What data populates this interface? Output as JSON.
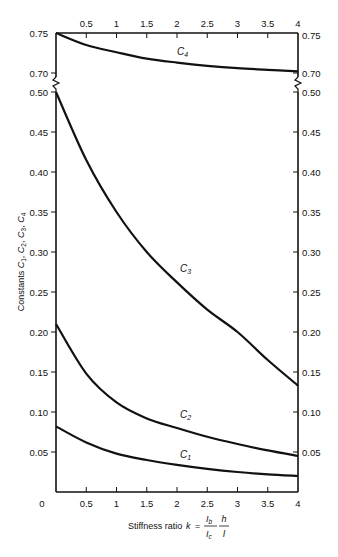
{
  "chart_data": {
    "type": "line",
    "title": "",
    "xlabel": "Stiffness ratio k = (I_b / I_c)(h / l)",
    "xlabel_parts": {
      "prefix": "Stiffness ratio",
      "var": "k",
      "eq": "=",
      "num1": "I",
      "num1_sub": "b",
      "den1": "I",
      "den1_sub": "c",
      "num2": "h",
      "den2": "l"
    },
    "ylabel": "Constants C1, C2, C3, C4",
    "ylabel_parts": {
      "prefix": "Constants",
      "terms": [
        "C1",
        "C2",
        "C3",
        "C4"
      ]
    },
    "xlim": [
      0,
      4
    ],
    "ylim_lower": [
      0,
      0.5
    ],
    "ylim_upper": [
      0.7,
      0.75
    ],
    "axis_break": "between 0.50 and 0.70 on both y axes",
    "x_ticks_bottom": [
      "0",
      "0.5",
      "1",
      "1.5",
      "2",
      "2.5",
      "3",
      "3.5",
      "4"
    ],
    "x_ticks_top": [
      "0.5",
      "1",
      "1.5",
      "2",
      "2.5",
      "3",
      "3.5",
      "4"
    ],
    "y_ticks_left": [
      "0.75",
      "0.70",
      "0.50",
      "0.45",
      "0.40",
      "0.35",
      "0.30",
      "0.25",
      "0.20",
      "0.15",
      "0.10",
      "0.05"
    ],
    "y_ticks_right": [
      "0.75",
      "0.70",
      "0.50",
      "0.45",
      "0.40",
      "0.35",
      "0.30",
      "0.25",
      "0.20",
      "0.15",
      "0.10",
      "0.05"
    ],
    "grid": false,
    "legend": "inline curve labels",
    "x": [
      0,
      0.5,
      1,
      1.5,
      2,
      2.5,
      3,
      3.5,
      4
    ],
    "series": [
      {
        "name": "C4",
        "label": "C4",
        "values": [
          0.75,
          0.735,
          0.726,
          0.718,
          0.713,
          0.709,
          0.706,
          0.704,
          0.702
        ]
      },
      {
        "name": "C3",
        "label": "C3",
        "values": [
          0.5,
          0.415,
          0.35,
          0.3,
          0.262,
          0.228,
          0.2,
          0.165,
          0.133
        ]
      },
      {
        "name": "C2",
        "label": "C2",
        "values": [
          0.21,
          0.148,
          0.112,
          0.092,
          0.08,
          0.069,
          0.06,
          0.052,
          0.045
        ]
      },
      {
        "name": "C1",
        "label": "C1",
        "values": [
          0.082,
          0.062,
          0.048,
          0.04,
          0.034,
          0.029,
          0.025,
          0.022,
          0.02
        ]
      }
    ]
  }
}
